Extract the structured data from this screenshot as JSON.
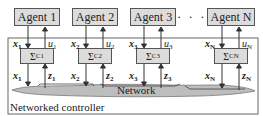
{
  "agents": [
    {
      "label": "Agent 1",
      "x_label": "x",
      "u_label": "u",
      "sub": "1",
      "sigma": "Σ",
      "sigma_sub": "C1"
    },
    {
      "label": "Agent 2",
      "x_label": "x",
      "u_label": "u",
      "sub": "2",
      "sigma": "Σ",
      "sigma_sub": "C2"
    },
    {
      "label": "Agent 3",
      "x_label": "x",
      "u_label": "u",
      "sub": "3",
      "sigma": "Σ",
      "sigma_sub": "C3"
    },
    {
      "label": "Agent N",
      "x_label": "x",
      "u_label": "u",
      "sub": "N",
      "sigma": "Σ",
      "sigma_sub": "CN"
    }
  ],
  "ellipsis": "· · ·",
  "z_label": "z",
  "network_label": "Network",
  "controller_label": "Networked controller",
  "colors": {
    "box_fill": "#dcdcdc",
    "network_fill": "#bdbdbd",
    "stroke": "#555555"
  }
}
